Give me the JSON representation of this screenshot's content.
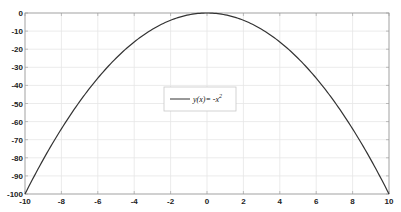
{
  "chart_data": {
    "type": "line",
    "title": "",
    "xlabel": "",
    "ylabel": "",
    "xlim": [
      -10,
      10
    ],
    "ylim": [
      -100,
      0
    ],
    "grid": true,
    "x_ticks": [
      -10,
      -8,
      -6,
      -4,
      -2,
      0,
      2,
      4,
      6,
      8,
      10
    ],
    "y_ticks": [
      0,
      -10,
      -20,
      -30,
      -40,
      -50,
      -60,
      -70,
      -80,
      -90,
      -100
    ],
    "series": [
      {
        "name": "y(x)= -x²",
        "function": "y = -x^2",
        "color": "#333333",
        "x": [
          -10,
          -9,
          -8,
          -7,
          -6,
          -5,
          -4,
          -3,
          -2,
          -1,
          0,
          1,
          2,
          3,
          4,
          5,
          6,
          7,
          8,
          9,
          10
        ],
        "y": [
          -100,
          -81,
          -64,
          -49,
          -36,
          -25,
          -16,
          -9,
          -4,
          -1,
          0,
          -1,
          -4,
          -9,
          -16,
          -25,
          -36,
          -49,
          -64,
          -81,
          -100
        ]
      }
    ],
    "legend": {
      "position": "center",
      "entries": [
        "y(x)= -x²"
      ],
      "label_main": "y(x)= -x",
      "label_sup": "2"
    }
  },
  "colors": {
    "line": "#333333",
    "grid": "#e6e6e6",
    "axis": "#999999",
    "background": "#ffffff"
  }
}
